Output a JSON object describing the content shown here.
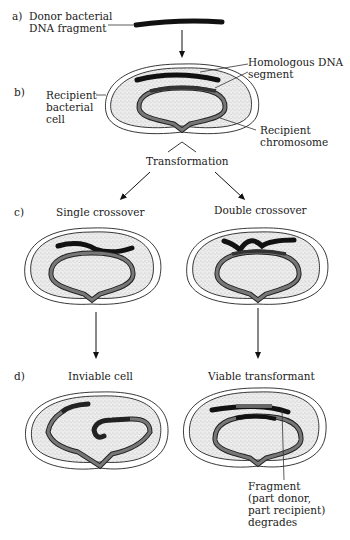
{
  "panels": {
    "a": {
      "tag": "a)",
      "label_line1": "Donor bacterial",
      "label_line2": "DNA fragment"
    },
    "b": {
      "tag": "b)",
      "homologous_line1": "Homologous DNA",
      "homologous_line2": "segment",
      "cell_line1": "Recipient",
      "cell_line2": "bacterial",
      "cell_line3": "cell",
      "chrom_line1": "Recipient",
      "chrom_line2": "chromosome"
    },
    "transformation": "Transformation",
    "c": {
      "tag": "c)",
      "left_title": "Single crossover",
      "right_title": "Double crossover"
    },
    "d": {
      "tag": "d)",
      "left_title": "Inviable cell",
      "right_title": "Viable transformant",
      "fragment_line1": "Fragment",
      "fragment_line2": "(part donor,",
      "fragment_line3": "part recipient)",
      "fragment_line4": "degrades"
    }
  },
  "colors": {
    "donor_dna": "#111111",
    "recipient_chromosome": "#6e6e6e",
    "cytoplasm": "#dcdcdc",
    "outline": "#222222"
  }
}
